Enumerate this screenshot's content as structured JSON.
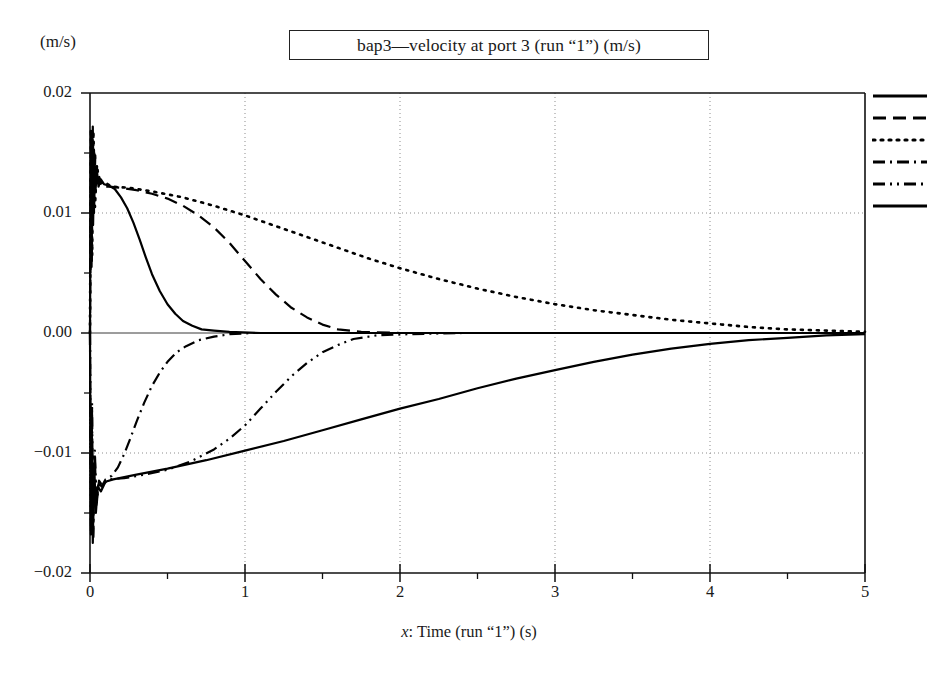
{
  "chart_data": {
    "type": "line",
    "title": "bap3—velocity at port 3 (run “1”) (m/s)",
    "xlabel": "x: Time (run “1”) (s)",
    "ylabel": "(m/s)",
    "xlim": [
      0,
      5
    ],
    "ylim": [
      -0.02,
      0.02
    ],
    "xticks": [
      "0",
      "1",
      "2",
      "3",
      "4",
      "5"
    ],
    "xtick_values": [
      0,
      1,
      2,
      3,
      4,
      5
    ],
    "yticks": [
      "0.02",
      "0.01",
      "0.00",
      "-0.01",
      "-0.02"
    ],
    "ytick_values": [
      0.02,
      0.01,
      0.0,
      -0.01,
      -0.02
    ],
    "x_minor_ticks": [
      0.5,
      1.5,
      2.5,
      3.5,
      4.5
    ],
    "y_minor_ticks": [
      0.015,
      0.005,
      -0.005,
      -0.015
    ],
    "grid": "dotted gridlines at major ticks",
    "legend_position": "right outside, no text labels",
    "line_color": "#000000",
    "grid_color": "#999999",
    "axis_color": "#000000",
    "series": [
      {
        "name": "series-1",
        "style": "solid",
        "description": "rises to 0.0123 plateau then decays to 0 by x~0.9",
        "points": [
          [
            0.0,
            0.0
          ],
          [
            0.005,
            0.015
          ],
          [
            0.01,
            0.0055
          ],
          [
            0.015,
            0.0165
          ],
          [
            0.02,
            0.009
          ],
          [
            0.028,
            0.015
          ],
          [
            0.035,
            0.0118
          ],
          [
            0.045,
            0.0135
          ],
          [
            0.055,
            0.0122
          ],
          [
            0.07,
            0.0128
          ],
          [
            0.09,
            0.0124
          ],
          [
            0.12,
            0.0123
          ],
          [
            0.16,
            0.012
          ],
          [
            0.2,
            0.0113
          ],
          [
            0.24,
            0.0104
          ],
          [
            0.28,
            0.0092
          ],
          [
            0.32,
            0.0078
          ],
          [
            0.36,
            0.0063
          ],
          [
            0.4,
            0.0049
          ],
          [
            0.45,
            0.0035
          ],
          [
            0.5,
            0.0024
          ],
          [
            0.55,
            0.0016
          ],
          [
            0.6,
            0.001
          ],
          [
            0.66,
            0.0006
          ],
          [
            0.72,
            0.0003
          ],
          [
            0.8,
            0.0002
          ],
          [
            0.9,
            0.0001
          ],
          [
            1.1,
            0.0
          ],
          [
            1.5,
            0.0
          ],
          [
            2.0,
            0.0
          ],
          [
            3.0,
            0.0
          ],
          [
            4.0,
            0.0
          ],
          [
            5.0,
            0.0
          ]
        ]
      },
      {
        "name": "series-2",
        "style": "dashed",
        "description": "holds near 0.0122 then decays to 0 by x~1.6",
        "points": [
          [
            0.0,
            0.0
          ],
          [
            0.006,
            0.0168
          ],
          [
            0.012,
            0.006
          ],
          [
            0.018,
            0.0172
          ],
          [
            0.026,
            0.01
          ],
          [
            0.034,
            0.0148
          ],
          [
            0.044,
            0.0124
          ],
          [
            0.06,
            0.013
          ],
          [
            0.08,
            0.0122
          ],
          [
            0.12,
            0.0122
          ],
          [
            0.2,
            0.0121
          ],
          [
            0.3,
            0.0119
          ],
          [
            0.4,
            0.0116
          ],
          [
            0.5,
            0.0112
          ],
          [
            0.6,
            0.0106
          ],
          [
            0.7,
            0.0098
          ],
          [
            0.8,
            0.0088
          ],
          [
            0.9,
            0.0075
          ],
          [
            1.0,
            0.006
          ],
          [
            1.1,
            0.0045
          ],
          [
            1.2,
            0.0032
          ],
          [
            1.3,
            0.0021
          ],
          [
            1.4,
            0.0013
          ],
          [
            1.5,
            0.0007
          ],
          [
            1.6,
            0.0003
          ],
          [
            1.75,
            0.0001
          ],
          [
            2.0,
            0.0
          ],
          [
            2.5,
            0.0
          ],
          [
            3.5,
            0.0
          ],
          [
            5.0,
            0.0
          ]
        ]
      },
      {
        "name": "series-3",
        "style": "dotted",
        "description": "slow exponential decay from 0.0122 reaching ~0 near x=4.3",
        "points": [
          [
            0.0,
            0.0
          ],
          [
            0.006,
            0.017
          ],
          [
            0.014,
            0.0065
          ],
          [
            0.022,
            0.0168
          ],
          [
            0.032,
            0.0105
          ],
          [
            0.045,
            0.014
          ],
          [
            0.06,
            0.0124
          ],
          [
            0.09,
            0.0126
          ],
          [
            0.14,
            0.0122
          ],
          [
            0.25,
            0.0121
          ],
          [
            0.4,
            0.0118
          ],
          [
            0.6,
            0.0113
          ],
          [
            0.8,
            0.0106
          ],
          [
            1.0,
            0.0098
          ],
          [
            1.2,
            0.0089
          ],
          [
            1.4,
            0.008
          ],
          [
            1.6,
            0.0071
          ],
          [
            1.8,
            0.0062
          ],
          [
            2.0,
            0.0054
          ],
          [
            2.25,
            0.0045
          ],
          [
            2.5,
            0.0037
          ],
          [
            2.75,
            0.003
          ],
          [
            3.0,
            0.0024
          ],
          [
            3.25,
            0.0019
          ],
          [
            3.5,
            0.0015
          ],
          [
            3.75,
            0.0011
          ],
          [
            4.0,
            0.0008
          ],
          [
            4.25,
            0.0005
          ],
          [
            4.5,
            0.0003
          ],
          [
            4.75,
            0.0002
          ],
          [
            5.0,
            0.0001
          ]
        ]
      },
      {
        "name": "series-4",
        "style": "dash-dot",
        "description": "negative branch from -0.0122 rising to 0 by x~0.95",
        "points": [
          [
            0.0,
            0.0
          ],
          [
            0.006,
            -0.0168
          ],
          [
            0.013,
            -0.0062
          ],
          [
            0.02,
            -0.017
          ],
          [
            0.03,
            -0.01
          ],
          [
            0.042,
            -0.0145
          ],
          [
            0.055,
            -0.0124
          ],
          [
            0.075,
            -0.0128
          ],
          [
            0.1,
            -0.0122
          ],
          [
            0.14,
            -0.0119
          ],
          [
            0.18,
            -0.0112
          ],
          [
            0.22,
            -0.0101
          ],
          [
            0.26,
            -0.0088
          ],
          [
            0.3,
            -0.0074
          ],
          [
            0.35,
            -0.0058
          ],
          [
            0.4,
            -0.0044
          ],
          [
            0.45,
            -0.0033
          ],
          [
            0.5,
            -0.0024
          ],
          [
            0.56,
            -0.0016
          ],
          [
            0.62,
            -0.0011
          ],
          [
            0.7,
            -0.0006
          ],
          [
            0.8,
            -0.0003
          ],
          [
            0.9,
            -0.0001
          ],
          [
            1.05,
            0.0
          ],
          [
            1.4,
            0.0
          ],
          [
            2.0,
            0.0
          ],
          [
            3.0,
            0.0
          ],
          [
            5.0,
            0.0
          ]
        ]
      },
      {
        "name": "series-5",
        "style": "dash-dot-dot",
        "description": "negative branch from -0.0122 rising to 0 by x~1.75",
        "points": [
          [
            0.0,
            0.0
          ],
          [
            0.006,
            -0.0165
          ],
          [
            0.013,
            -0.0058
          ],
          [
            0.021,
            -0.0172
          ],
          [
            0.031,
            -0.0098
          ],
          [
            0.043,
            -0.0142
          ],
          [
            0.058,
            -0.0123
          ],
          [
            0.08,
            -0.0127
          ],
          [
            0.12,
            -0.0122
          ],
          [
            0.22,
            -0.0121
          ],
          [
            0.35,
            -0.0118
          ],
          [
            0.5,
            -0.0114
          ],
          [
            0.65,
            -0.0107
          ],
          [
            0.8,
            -0.0097
          ],
          [
            0.9,
            -0.0088
          ],
          [
            1.0,
            -0.0077
          ],
          [
            1.1,
            -0.0063
          ],
          [
            1.2,
            -0.0049
          ],
          [
            1.3,
            -0.0036
          ],
          [
            1.4,
            -0.0025
          ],
          [
            1.5,
            -0.0016
          ],
          [
            1.6,
            -0.001
          ],
          [
            1.7,
            -0.0005
          ],
          [
            1.85,
            -0.0002
          ],
          [
            2.05,
            -0.0001
          ],
          [
            2.4,
            0.0
          ],
          [
            3.0,
            0.0
          ],
          [
            5.0,
            0.0
          ]
        ]
      },
      {
        "name": "series-6",
        "style": "solid",
        "description": "slowest negative branch, -0.0122 rising gradually to ~0 at x=4.3",
        "points": [
          [
            0.0,
            0.0
          ],
          [
            0.005,
            -0.016
          ],
          [
            0.011,
            -0.007
          ],
          [
            0.018,
            -0.0175
          ],
          [
            0.027,
            -0.011
          ],
          [
            0.038,
            -0.015
          ],
          [
            0.05,
            -0.0128
          ],
          [
            0.07,
            -0.0132
          ],
          [
            0.1,
            -0.0124
          ],
          [
            0.15,
            -0.0122
          ],
          [
            0.3,
            -0.0118
          ],
          [
            0.5,
            -0.0113
          ],
          [
            0.75,
            -0.0106
          ],
          [
            1.0,
            -0.0098
          ],
          [
            1.25,
            -0.009
          ],
          [
            1.5,
            -0.0081
          ],
          [
            1.75,
            -0.0072
          ],
          [
            2.0,
            -0.0063
          ],
          [
            2.25,
            -0.0055
          ],
          [
            2.5,
            -0.0046
          ],
          [
            2.75,
            -0.0038
          ],
          [
            3.0,
            -0.0031
          ],
          [
            3.25,
            -0.0024
          ],
          [
            3.5,
            -0.0018
          ],
          [
            3.75,
            -0.0013
          ],
          [
            4.0,
            -0.0009
          ],
          [
            4.25,
            -0.0006
          ],
          [
            4.5,
            -0.0004
          ],
          [
            4.75,
            -0.0002
          ],
          [
            5.0,
            -0.0001
          ]
        ]
      }
    ]
  },
  "legend": {
    "entries": [
      {
        "name": "legend-item-1",
        "style": "solid",
        "label": ""
      },
      {
        "name": "legend-item-2",
        "style": "dashed",
        "label": ""
      },
      {
        "name": "legend-item-3",
        "style": "dotted",
        "label": ""
      },
      {
        "name": "legend-item-4",
        "style": "dash-dot",
        "label": ""
      },
      {
        "name": "legend-item-5",
        "style": "dash-dot-dot",
        "label": ""
      },
      {
        "name": "legend-item-6",
        "style": "solid",
        "label": ""
      }
    ]
  },
  "axis_labels": {
    "y_unit": "(m/s)",
    "x_title": "x: Time (run “1”) (s)",
    "x_title_italic_prefix": "x",
    "x_title_rest": ": Time (run “1”) (s)"
  }
}
